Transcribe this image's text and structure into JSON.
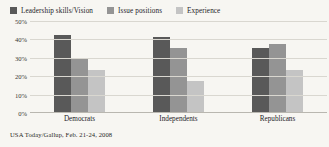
{
  "chart_data": {
    "type": "bar",
    "title": "",
    "xlabel": "",
    "ylabel": "",
    "ylim": [
      0,
      50
    ],
    "grid": true,
    "legend_position": "top-left",
    "categories": [
      "Democrats",
      "Independents",
      "Republicans"
    ],
    "ytick_labels": [
      "50%",
      "40%",
      "30%",
      "20%",
      "10%",
      "0%"
    ],
    "ytick_values": [
      50,
      40,
      30,
      20,
      10,
      0
    ],
    "series": [
      {
        "name": "Leadership skills/Vision",
        "color": "#595959",
        "values": [
          42,
          41,
          35
        ]
      },
      {
        "name": "Issue positions",
        "color": "#949494",
        "values": [
          29,
          35,
          37
        ]
      },
      {
        "name": "Experience",
        "color": "#c4c4c4",
        "values": [
          23,
          17,
          23
        ]
      }
    ],
    "source": "USA Today/Gallup, Feb. 21-24, 2008"
  }
}
